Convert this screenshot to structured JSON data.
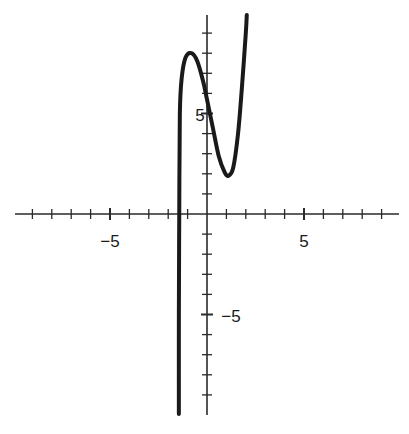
{
  "chart_data": {
    "type": "line",
    "title": "",
    "xlabel": "",
    "ylabel": "",
    "xlim": [
      -9.2,
      9.9
    ],
    "ylim": [
      -10,
      10
    ],
    "grid": false,
    "legend": null,
    "x_tick_labels": [
      {
        "value": -5,
        "text": "−5"
      },
      {
        "value": 5,
        "text": "5"
      }
    ],
    "y_tick_labels": [
      {
        "value": 5,
        "text": "5"
      },
      {
        "value": -5,
        "text": "−5"
      }
    ],
    "x_ticks": [
      -9,
      -8,
      -7,
      -6,
      -5,
      -4,
      -3,
      -2,
      -1,
      1,
      2,
      3,
      4,
      5,
      6,
      7,
      8,
      9
    ],
    "y_ticks": [
      -9,
      -8,
      -7,
      -6,
      -5,
      -4,
      -3,
      -2,
      -1,
      1,
      2,
      3,
      4,
      5,
      6,
      7,
      8,
      9
    ],
    "series": [
      {
        "name": "curve",
        "description": "cubic-like curve with vertical asymptote near x=-1.4, local max ~(-0.8, 8), local min ~(1.1, 1.9)",
        "points": [
          [
            -1.45,
            -10
          ],
          [
            -1.45,
            -5
          ],
          [
            -1.43,
            0
          ],
          [
            -1.4,
            5
          ],
          [
            -1.3,
            6.8
          ],
          [
            -1.1,
            7.8
          ],
          [
            -0.8,
            8.0
          ],
          [
            -0.5,
            7.6
          ],
          [
            -0.2,
            6.6
          ],
          [
            0,
            5.7
          ],
          [
            0.3,
            4.3
          ],
          [
            0.6,
            2.9
          ],
          [
            0.9,
            2.1
          ],
          [
            1.1,
            1.9
          ],
          [
            1.35,
            2.3
          ],
          [
            1.6,
            4.0
          ],
          [
            1.8,
            6.3
          ],
          [
            2.0,
            9.0
          ],
          [
            2.05,
            10
          ]
        ]
      }
    ],
    "key_points": {
      "local_max": [
        -0.8,
        8.0
      ],
      "local_min": [
        1.1,
        1.9
      ],
      "y_intercept": 5.7,
      "vertical_asymptote_x": -1.4
    }
  },
  "labels": {
    "x_neg5": "−5",
    "x_pos5": "5",
    "y_pos5": "5",
    "y_neg5": "−5"
  },
  "colors": {
    "curve": "#1a1a1a",
    "axes": "#2a2a2a",
    "background": "#ffffff"
  }
}
